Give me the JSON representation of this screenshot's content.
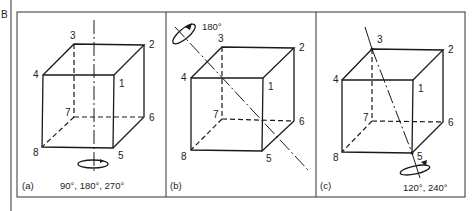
{
  "figure": {
    "label": "B",
    "panels": [
      {
        "id": "a",
        "caption": "(a)",
        "rotation_label": "90°, 180°, 270°",
        "axis": "vertical through face centres",
        "vertex_labels": [
          "1",
          "2",
          "3",
          "4",
          "5",
          "6",
          "7",
          "8"
        ]
      },
      {
        "id": "b",
        "caption": "(b)",
        "rotation_label": "180°",
        "axis": "through edge midpoints",
        "vertex_labels": [
          "1",
          "2",
          "3",
          "4",
          "5",
          "6",
          "7",
          "8"
        ]
      },
      {
        "id": "c",
        "caption": "(c)",
        "rotation_label": "120°, 240°",
        "axis": "body diagonal 3–5",
        "vertex_labels": [
          "1",
          "2",
          "3",
          "4",
          "5",
          "6",
          "7",
          "8"
        ]
      }
    ]
  }
}
